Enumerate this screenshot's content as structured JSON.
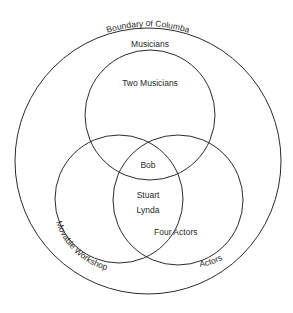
{
  "diagram": {
    "type": "venn",
    "sets": [
      {
        "id": "boundary",
        "label": "Boundary of Columba",
        "cx": 148,
        "cy": 161,
        "r": 133
      },
      {
        "id": "musicians",
        "label": "Musicians",
        "cx": 150,
        "cy": 115,
        "r": 65
      },
      {
        "id": "movable_workshop",
        "label": "Movable Workshop",
        "cx": 119,
        "cy": 199,
        "r": 64
      },
      {
        "id": "actors",
        "label": "Actors",
        "cx": 178,
        "cy": 200,
        "r": 65
      }
    ],
    "region_labels": {
      "two_musicians": "Two Musicians",
      "bob": "Bob",
      "stuart": "Stuart",
      "lynda": "Lynda",
      "four_actors": "Four Actors"
    },
    "stroke_color": "#2b2b2b",
    "background": "#ffffff"
  }
}
